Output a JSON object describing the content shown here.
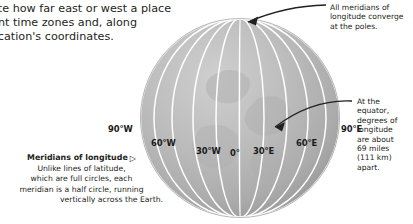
{
  "intro": {
    "lines": [
      "ate how far east or west a place",
      "ent time zones and, along",
      "ocation's coordinates."
    ]
  },
  "callouts": {
    "poles": {
      "lines": [
        "All meridians of",
        "longitude converge",
        "at the poles."
      ]
    },
    "equator": {
      "lines": [
        "At the",
        "equator,",
        "degrees of",
        "longitude",
        "are about",
        "69 miles",
        "(111 km)",
        "apart."
      ]
    }
  },
  "caption": {
    "title": "Meridians of longitude",
    "marker": "▷",
    "lines": [
      "Unlike lines of latitude,",
      "which are full circles, each",
      "meridian is a half circle, running",
      "vertically across the Earth."
    ]
  },
  "globe": {
    "longitude_labels": [
      {
        "text": "90°W",
        "x": 108,
        "y": 124
      },
      {
        "text": "60°W",
        "x": 151,
        "y": 138
      },
      {
        "text": "30°W",
        "x": 196,
        "y": 146
      },
      {
        "text": "0°",
        "x": 230,
        "y": 148
      },
      {
        "text": "30°E",
        "x": 253,
        "y": 146
      },
      {
        "text": "60°E",
        "x": 296,
        "y": 138
      },
      {
        "text": "90°E",
        "x": 341,
        "y": 124
      }
    ],
    "colors": {
      "sphere_light": "#c8c8c8",
      "sphere_mid": "#b4b4b4",
      "sphere_dark": "#9d9d9d",
      "meridian": "#ffffff",
      "arrow": "#231f20"
    }
  }
}
